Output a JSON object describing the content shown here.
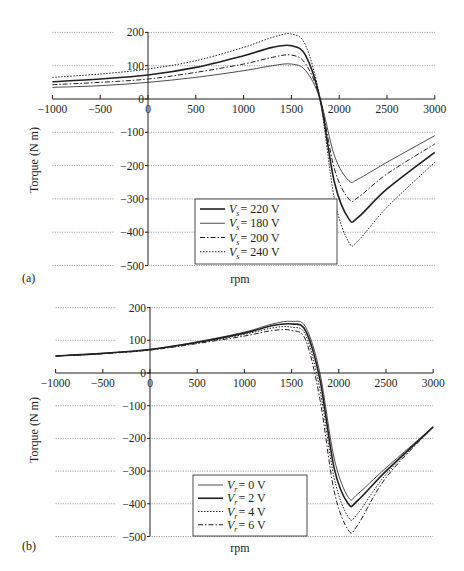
{
  "chart_data": [
    {
      "panel": "(a)",
      "type": "line",
      "title": "",
      "xlabel": "rpm",
      "ylabel": "Torque (N m)",
      "xlim": [
        -1000,
        3000
      ],
      "ylim": [
        -500,
        200
      ],
      "x_ticks": [
        -1000,
        -500,
        0,
        500,
        1000,
        1500,
        2000,
        2500,
        3000
      ],
      "y_ticks": [
        200,
        100,
        0,
        -100,
        -200,
        -300,
        -400,
        -500
      ],
      "grid": "horizontal dotted",
      "legend_position": "lower center",
      "x": [
        -1000,
        -500,
        0,
        500,
        1000,
        1300,
        1500,
        1650,
        1800,
        1950,
        2100,
        2200,
        2500,
        3000
      ],
      "series": [
        {
          "name": "V_s = 220 V",
          "style": "solid-thick",
          "values": [
            52,
            60,
            72,
            95,
            130,
            155,
            160,
            130,
            0,
            -250,
            -360,
            -355,
            -270,
            -160
          ]
        },
        {
          "name": "V_s = 180 V",
          "style": "solid-thin",
          "values": [
            35,
            40,
            50,
            65,
            85,
            100,
            105,
            85,
            0,
            -170,
            -245,
            -240,
            -190,
            -110
          ]
        },
        {
          "name": "V_s = 200 V",
          "style": "dash-dot",
          "values": [
            43,
            50,
            60,
            80,
            105,
            125,
            132,
            105,
            0,
            -210,
            -300,
            -295,
            -225,
            -135
          ]
        },
        {
          "name": "V_s = 240 V",
          "style": "dotted",
          "values": [
            65,
            75,
            90,
            115,
            155,
            185,
            195,
            160,
            0,
            -300,
            -430,
            -425,
            -325,
            -190
          ]
        }
      ]
    },
    {
      "panel": "(b)",
      "type": "line",
      "title": "",
      "xlabel": "rpm",
      "ylabel": "Torque (N m)",
      "xlim": [
        -1000,
        3000
      ],
      "ylim": [
        -500,
        200
      ],
      "x_ticks": [
        -1000,
        -500,
        0,
        500,
        1000,
        1500,
        2000,
        2500,
        3000
      ],
      "y_ticks": [
        200,
        100,
        0,
        -100,
        -200,
        -300,
        -400,
        -500
      ],
      "grid": "horizontal dotted",
      "legend_position": "lower center",
      "x": [
        -1000,
        -500,
        0,
        500,
        1000,
        1300,
        1500,
        1650,
        1800,
        1950,
        2100,
        2200,
        2500,
        3000
      ],
      "series": [
        {
          "name": "V_r = 0 V",
          "style": "solid-thin",
          "values": [
            52,
            60,
            72,
            95,
            125,
            150,
            158,
            140,
            0,
            -260,
            -380,
            -370,
            -290,
            -165
          ]
        },
        {
          "name": "V_r = 2 V",
          "style": "solid-thick",
          "values": [
            52,
            60,
            72,
            94,
            122,
            145,
            150,
            128,
            -20,
            -290,
            -400,
            -390,
            -300,
            -165
          ]
        },
        {
          "name": "V_r = 4 V",
          "style": "dotted",
          "values": [
            52,
            60,
            71,
            92,
            118,
            138,
            140,
            115,
            -50,
            -320,
            -440,
            -430,
            -310,
            -165
          ]
        },
        {
          "name": "V_r = 6 V",
          "style": "dash-dot",
          "values": [
            52,
            59,
            70,
            90,
            113,
            130,
            130,
            100,
            -80,
            -360,
            -480,
            -465,
            -320,
            -165
          ]
        }
      ]
    }
  ],
  "panels": {
    "a": {
      "tag": "(a)",
      "xlabel": "rpm",
      "ylabel": "Torque (N m)",
      "legend": [
        "V_s = 220 V",
        "V_s = 180 V",
        "V_s = 200 V",
        "V_s = 240 V"
      ],
      "legend_sub": "s",
      "legend_vals": [
        "= 220 V",
        "= 180 V",
        "= 200 V",
        "= 240 V"
      ]
    },
    "b": {
      "tag": "(b)",
      "xlabel": "rpm",
      "ylabel": "Torque (N m)",
      "legend": [
        "V_r = 0 V",
        "V_r = 2 V",
        "V_r = 4 V",
        "V_r = 6 V"
      ],
      "legend_sub": "r",
      "legend_vals": [
        "= 0 V",
        "= 2 V",
        "= 4 V",
        "= 6 V"
      ]
    }
  },
  "tick_labels": {
    "x": [
      "−1000",
      "−500",
      "0",
      "500",
      "1000",
      "1500",
      "2000",
      "2500",
      "3000"
    ],
    "y": [
      "200",
      "100",
      "0",
      "−100",
      "−200",
      "−300",
      "−400",
      "−500"
    ]
  },
  "colors": {
    "ink": "#231f20",
    "grid": "#8a8a8a",
    "background": "#ffffff"
  }
}
